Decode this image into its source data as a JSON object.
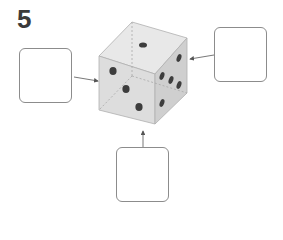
{
  "question": {
    "number": "5"
  },
  "die": {
    "faces": [
      {
        "face": "top",
        "pips": 1
      },
      {
        "face": "front",
        "pips": 3
      },
      {
        "face": "right",
        "pips": 6
      }
    ],
    "colors": {
      "top": "#e6e6e6",
      "front": "#dcdcdc",
      "right": "#cfcfcf",
      "pip": "#3d3d3d",
      "edge": "#a0a0a0"
    }
  },
  "answer_boxes": [
    {
      "id": "left",
      "points_to": "front face",
      "value": ""
    },
    {
      "id": "right",
      "points_to": "right face",
      "value": ""
    },
    {
      "id": "bottom",
      "points_to": "bottom face",
      "value": ""
    }
  ]
}
